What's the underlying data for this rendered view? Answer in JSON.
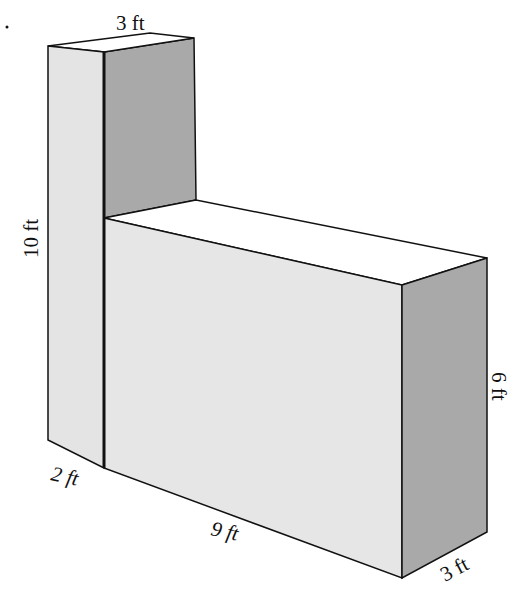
{
  "diagram": {
    "type": "composite-rectangular-prism",
    "labels": {
      "tall_top_width": "3 ft",
      "tall_height": "10 ft",
      "tall_front_depth": "2 ft",
      "low_length": "9 ft",
      "low_height": "6 ft",
      "low_depth": "3 ft"
    },
    "colors": {
      "front_face": "#e4e4e4",
      "side_face": "#a9a9a9",
      "top_face": "#ffffff",
      "edge": "#111111"
    }
  }
}
